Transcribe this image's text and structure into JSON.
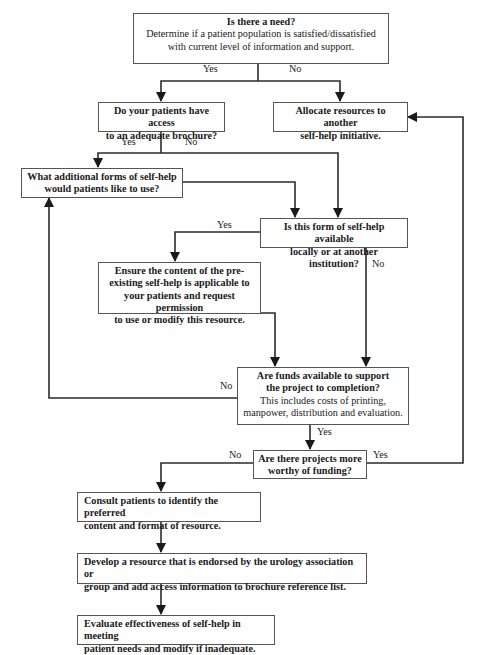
{
  "nodes": {
    "need": {
      "title": "Is there a need?",
      "line1": "Determine if a patient population is satisfied/dissatisfied",
      "line2": "with current level of information and support."
    },
    "brochure": {
      "line1": "Do your patients have access",
      "line2": "to an adequate brochure?"
    },
    "allocate": {
      "line1": "Allocate resources to another",
      "line2": "self-help initiative."
    },
    "additional": {
      "line1": "What additional forms of self-help",
      "line2": "would patients like to use?"
    },
    "available": {
      "line1": "Is this form of self-help available",
      "line2": "locally or at another institution?"
    },
    "ensure": {
      "line1": "Ensure the content of the pre-",
      "line2": "existing self-help is applicable to",
      "line3": "your patients and request permission",
      "line4": "to use or modify this resource."
    },
    "funds": {
      "line1": "Are funds available to support",
      "line2": "the project to completion?",
      "line3": "This includes costs of printing,",
      "line4": "manpower, distribution and evaluation."
    },
    "worthy": {
      "line1": "Are there projects more",
      "line2": "worthy of funding?"
    },
    "consult": {
      "line1": "Consult patients to identify the preferred",
      "line2": "content and format of resource."
    },
    "develop": {
      "line1": "Develop a resource that is endorsed by the urology association or",
      "line2": "group and add access information to brochure reference list."
    },
    "evaluate": {
      "line1": "Evaluate effectiveness of self-help in meeting",
      "line2": "patient needs and modify if inadequate."
    }
  },
  "edge_labels": {
    "need_yes": "Yes",
    "need_no": "No",
    "brochure_yes": "Yes",
    "brochure_no": "No",
    "available_yes": "Yes",
    "available_no": "No",
    "funds_no": "No",
    "funds_yes": "Yes",
    "worthy_no": "No",
    "worthy_yes": "Yes"
  },
  "colors": {
    "line": "#2b2b2b",
    "border": "#555555",
    "text": "#1a1a1a"
  }
}
